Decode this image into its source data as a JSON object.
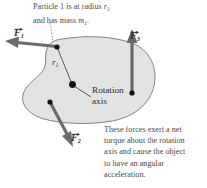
{
  "figure": {
    "type": "physics-free-body-diagram",
    "body_fill": "#e3e3e3",
    "body_stroke": "#6e6e6e",
    "arrow_color": "#6b6b6b",
    "dot_color": "#111111",
    "text_color": "#4a4a4a"
  },
  "captions": {
    "top": {
      "line1_a": "Particle 1 is at radius ",
      "line1_sym": "r",
      "line1_sub": "1",
      "line2_a": "and has mass ",
      "line2_sym": "m",
      "line2_sub": "1",
      "line2_end": "."
    },
    "bottom": {
      "line1": "These forces exert a net",
      "line2": "torque about the rotation",
      "line3": "axis and cause the object",
      "line4": "to have an angular",
      "line5": "acceleration."
    }
  },
  "labels": {
    "rotation_axis_line1": "Rotation",
    "rotation_axis_line2": "axis",
    "radius_symbol": "r",
    "radius_subscript": "1",
    "force1_symbol": "F",
    "force1_subscript": "1",
    "force2_symbol": "F",
    "force2_subscript": "2",
    "force3_symbol": "F",
    "force3_subscript": "3"
  },
  "vectors": [
    {
      "name": "F1",
      "from": [
        57,
        47
      ],
      "to": [
        9,
        42
      ],
      "direction": "left"
    },
    {
      "name": "F2",
      "from": [
        50,
        102
      ],
      "to": [
        74,
        146
      ],
      "direction": "down-left"
    },
    {
      "name": "F3",
      "from": [
        132,
        93
      ],
      "to": [
        132,
        33
      ],
      "direction": "up"
    }
  ],
  "points": [
    {
      "name": "particle-1",
      "at": [
        57,
        47
      ]
    },
    {
      "name": "rotation-axis",
      "at": [
        73,
        85
      ]
    },
    {
      "name": "force2-application-point",
      "at": [
        50,
        102
      ]
    },
    {
      "name": "force3-application-point",
      "at": [
        132,
        93
      ]
    }
  ]
}
